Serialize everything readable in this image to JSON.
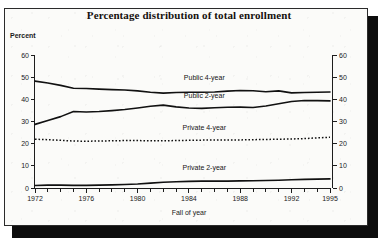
{
  "panel": {
    "title": "Percentage distribution of total enrollment"
  },
  "axes": {
    "y_left_label": "Percent",
    "x_label": "Fall of year"
  },
  "chart_data": {
    "type": "line",
    "title": "Percentage distribution of total enrollment",
    "xlabel": "Fall of year",
    "ylabel": "Percent",
    "xlim": [
      1972,
      1995
    ],
    "ylim": [
      0,
      60
    ],
    "grid": false,
    "legend_position": "inline-labels",
    "y_left_ticks": [
      0,
      10,
      20,
      30,
      40,
      50,
      60
    ],
    "y_right_ticks": [
      0,
      10,
      20,
      30,
      40,
      50,
      60
    ],
    "x_ticklabels": [
      "1972",
      "1976",
      "1980",
      "1984",
      "1988",
      "1992",
      "1995"
    ],
    "x_tickvalues": [
      1972,
      1976,
      1980,
      1984,
      1988,
      1992,
      1995
    ],
    "x_minor_ticks": [
      1973,
      1974,
      1975,
      1977,
      1978,
      1979,
      1981,
      1982,
      1983,
      1985,
      1986,
      1987,
      1989,
      1990,
      1991,
      1993,
      1994
    ],
    "x": [
      1972,
      1973,
      1974,
      1975,
      1976,
      1977,
      1978,
      1979,
      1980,
      1981,
      1982,
      1983,
      1984,
      1985,
      1986,
      1987,
      1988,
      1989,
      1990,
      1991,
      1992,
      1993,
      1994,
      1995
    ],
    "series": [
      {
        "name": "Public 4-year",
        "style": "solid",
        "label_x": 1985.2,
        "label_y": 48.5,
        "values": [
          48.2,
          47.4,
          46.3,
          45.0,
          44.9,
          44.6,
          44.4,
          44.2,
          43.8,
          43.2,
          42.8,
          43.1,
          43.2,
          43.2,
          43.3,
          43.7,
          44.0,
          43.9,
          43.4,
          43.8,
          42.9,
          43.1,
          43.2,
          43.3
        ]
      },
      {
        "name": "Public 2-year",
        "style": "solid",
        "label_x": 1985.2,
        "label_y": 40.5,
        "values": [
          28.7,
          30.5,
          32.2,
          34.5,
          34.3,
          34.5,
          34.9,
          35.4,
          36.1,
          36.9,
          37.4,
          36.6,
          36.1,
          35.9,
          36.2,
          36.4,
          36.5,
          36.3,
          37.0,
          38.0,
          39.0,
          39.5,
          39.4,
          39.3
        ]
      },
      {
        "name": "Private 4-year",
        "style": "dotted",
        "label_x": 1985.2,
        "label_y": 26.0,
        "values": [
          22.0,
          21.8,
          21.5,
          21.2,
          21.1,
          21.2,
          21.3,
          21.4,
          21.4,
          21.3,
          21.3,
          21.4,
          21.5,
          21.6,
          21.6,
          21.7,
          21.7,
          21.8,
          21.9,
          22.0,
          22.1,
          22.3,
          22.6,
          22.9
        ]
      },
      {
        "name": "Private 2-year",
        "style": "solid",
        "label_x": 1985.2,
        "label_y": 8.0,
        "values": [
          1.1,
          1.3,
          1.3,
          1.2,
          1.2,
          1.3,
          1.4,
          1.6,
          1.8,
          2.2,
          2.6,
          2.8,
          3.0,
          3.1,
          3.1,
          3.1,
          3.2,
          3.3,
          3.4,
          3.5,
          3.7,
          3.9,
          4.0,
          4.1
        ]
      }
    ]
  }
}
